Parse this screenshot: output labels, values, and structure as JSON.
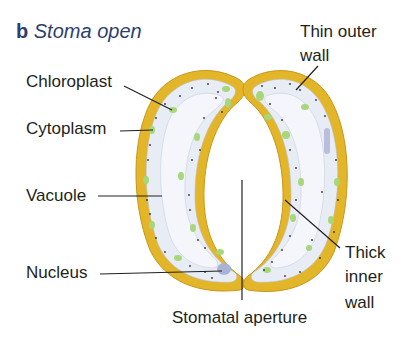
{
  "title": {
    "letter": "b",
    "text": "Stoma open"
  },
  "labels": {
    "chloroplast": "Chloroplast",
    "cytoplasm": "Cytoplasm",
    "vacuole": "Vacuole",
    "nucleus": "Nucleus",
    "thin_outer_wall_line1": "Thin outer",
    "thin_outer_wall_line2": "wall",
    "thick_inner_wall_line1": "Thick",
    "thick_inner_wall_line2": "inner",
    "thick_inner_wall_line3": "wall",
    "stomatal_aperture": "Stomatal aperture"
  },
  "colors": {
    "wall": "#e3b62a",
    "wall_edge": "#c9961a",
    "cytoplasm": "#e8ecf4",
    "vacuole": "#f4f6fb",
    "chloroplast": "#a8d67a",
    "nucleus": "#a9b3d6",
    "leader_line": "#231f20",
    "title": "#2d3f6e"
  }
}
